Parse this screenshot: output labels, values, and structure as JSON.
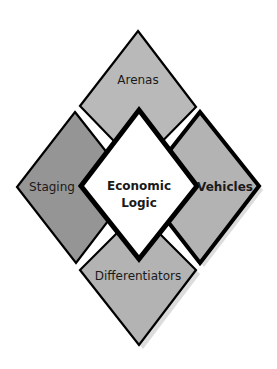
{
  "diagram": {
    "center": {
      "line1": "Economic",
      "line2": "Logic",
      "fill": "#ffffff"
    },
    "segments": [
      {
        "id": "arenas",
        "label": "Arenas",
        "fill": "#b9b9b9",
        "bold": false
      },
      {
        "id": "staging",
        "label": "Staging",
        "fill": "#959595",
        "bold": false
      },
      {
        "id": "vehicles",
        "label": "Vehicles",
        "fill": "#b3b3b3",
        "bold": true
      },
      {
        "id": "differentiators",
        "label": "Differentiators",
        "fill": "#b3b3b3",
        "bold": false
      }
    ],
    "colors": {
      "stroke": "#000000",
      "shadow": "#d9d9d9"
    }
  }
}
